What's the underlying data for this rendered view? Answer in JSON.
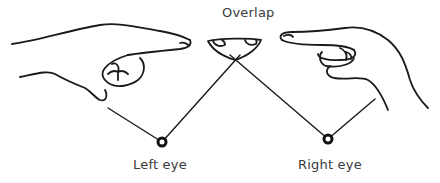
{
  "labels": {
    "overlap": "Overlap",
    "left_eye": "Left eye",
    "right_eye": "Right eye"
  },
  "colors": {
    "ink": "#1a1a1a",
    "text": "#3a3a3a",
    "background": "#ffffff"
  },
  "elements": {
    "left_hand": "pointing-hand-from-left",
    "right_hand": "pointing-hand-from-right",
    "overlap_shape": "overlapping-fingertips-bowl",
    "sight_lines": 2,
    "eyes": 2
  }
}
